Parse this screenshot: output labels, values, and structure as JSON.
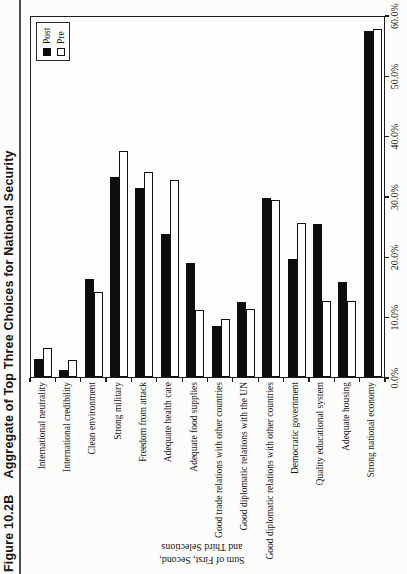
{
  "figure": {
    "label": "Figure 10.2B",
    "title": "Aggregate of Top Three Choices for National Security"
  },
  "legend": {
    "position": "top-right-of-plot",
    "items": [
      {
        "label": "Post",
        "fill": "#0d0d0d"
      },
      {
        "label": "Pre",
        "fill": "#ffffff"
      }
    ]
  },
  "axis_title": {
    "line1": "Sum of First, Second,",
    "line2": "and Third Selections"
  },
  "chart_data": {
    "type": "bar",
    "note": "Horizontal paired-bar chart printed rotated 90 degrees CCW on the page; bars appear as vertical columns in the screenshot",
    "category_axis_label": "Sum of First, Second, and Third Selections",
    "value_axis_ticks": [
      "0.0%",
      "10.0%",
      "20.0%",
      "30.0%",
      "40.0%",
      "50.0%",
      "60.0%"
    ],
    "xlim": [
      0,
      60
    ],
    "grid": false,
    "categories": [
      "International neutrality",
      "International credibility",
      "Clean environment",
      "Strong military",
      "Freedom from attack",
      "Adequate health care",
      "Adequate food supplies",
      "Good trade relations with other countries",
      "Good diplomatic relations with the UN",
      "Good diplomatic relations with other countries",
      "Democratic government",
      "Quality educational system",
      "Adequate housing",
      "Strong national economy"
    ],
    "series": [
      {
        "name": "Post",
        "values": [
          3.0,
          1.2,
          16.2,
          33.1,
          31.4,
          23.7,
          18.9,
          8.4,
          12.4,
          29.7,
          19.5,
          25.3,
          15.7,
          57.3
        ]
      },
      {
        "name": "Pre",
        "values": [
          4.8,
          2.8,
          14.1,
          37.4,
          34.0,
          32.6,
          11.1,
          9.6,
          11.2,
          29.4,
          25.6,
          12.6,
          12.6,
          57.6
        ]
      }
    ]
  },
  "colors": {
    "ink": "#141414",
    "paper": "#fcfcfa",
    "post_fill": "#0d0d0d",
    "pre_fill": "#ffffff"
  }
}
